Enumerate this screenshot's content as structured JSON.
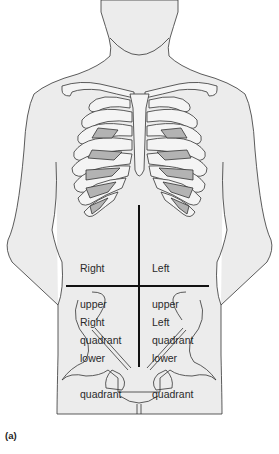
{
  "figure": {
    "panel_label": "(a)",
    "colors": {
      "background": "#ffffff",
      "skin_fill": "#ececec",
      "bone_fill": "#f4f4f4",
      "cartilage_shade": "#b3b3b3",
      "outline": "#333333",
      "quadrant_lines": "#111111"
    },
    "quadrants": [
      {
        "id": "ruq",
        "line1": "Right",
        "line2": "upper",
        "line3": "quadrant"
      },
      {
        "id": "luq",
        "line1": "Left",
        "line2": "upper",
        "line3": "quadrant"
      },
      {
        "id": "rlq",
        "line1": "Right",
        "line2": "lower",
        "line3": "quadrant"
      },
      {
        "id": "llq",
        "line1": "Left",
        "line2": "lower",
        "line3": "quadrant"
      }
    ],
    "divider": {
      "vertical": {
        "x": 139,
        "y1": 205,
        "y2": 367
      },
      "horizontal": {
        "y": 286,
        "x1": 66,
        "x2": 209
      }
    }
  }
}
